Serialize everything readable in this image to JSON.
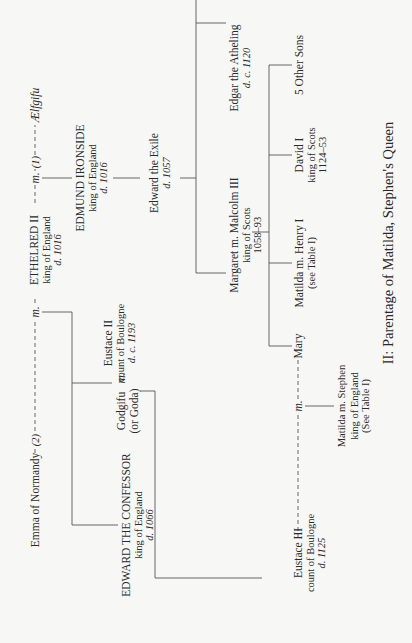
{
  "title": "II: Parentage of Matilda, Stephen's Queen",
  "marriage_marker": "m.",
  "people": {
    "emma": {
      "name": "Emma of Normandy"
    },
    "ethelred": {
      "name": "ETHELRED II",
      "title": "king of England",
      "death": "d. 1016"
    },
    "aelfgifu": {
      "name": "Ælfgifu"
    },
    "edmund": {
      "name": "EDMUND IRONSIDE",
      "title": "king of England",
      "death": "d. 1016"
    },
    "godgifu": {
      "name": "Godgifu",
      "alt": "(or Goda)"
    },
    "eustace2": {
      "name": "Eustace II",
      "title": "count of Boulogne",
      "death": "d. c. 1193"
    },
    "confessor": {
      "name": "EDWARD THE CONFESSOR",
      "title": "king of England",
      "death": "d. 1066"
    },
    "exile": {
      "name": "Edward the Exile",
      "death": "d. 1057"
    },
    "edgar": {
      "name": "Edgar the Atheling",
      "death": "d. c. 1120"
    },
    "margaret_malcolm": {
      "name": "Margaret m. Malcolm III",
      "title": "king of Scots",
      "reign": "1058–93"
    },
    "other_sons": {
      "name": "5 Other Sons"
    },
    "david": {
      "name": "David I",
      "title": "king of Scots",
      "reign": "1124–53"
    },
    "matilda_henry": {
      "name": "Matilda m. Henry I",
      "note": "(see Table I)"
    },
    "mary": {
      "name": "Mary"
    },
    "eustace3": {
      "name": "Eustace III",
      "title": "count of Boulogne",
      "death": "d. 1125"
    },
    "matilda_stephen": {
      "name": "Matilda m. Stephen",
      "title": "king of England",
      "note": "(See Table I)"
    }
  },
  "marriage_order": {
    "first": "(1)",
    "second": "(2)"
  }
}
